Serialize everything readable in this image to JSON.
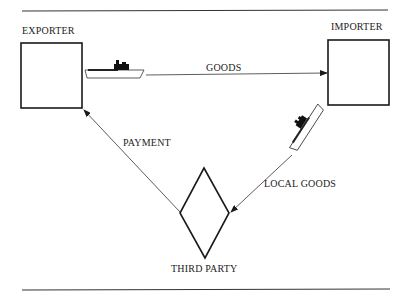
{
  "diagram": {
    "nodes": {
      "exporter": {
        "label": "EXPORTER",
        "shape": "square"
      },
      "importer": {
        "label": "IMPORTER",
        "shape": "square"
      },
      "third_party": {
        "label": "THIRD PARTY",
        "shape": "diamond"
      }
    },
    "edges": {
      "goods": {
        "label": "GOODS",
        "from": "exporter",
        "to": "importer",
        "icon": "ship-icon"
      },
      "local_goods": {
        "label": "LOCAL GOODS",
        "from": "importer",
        "to": "third_party",
        "icon": "ship-icon"
      },
      "payment": {
        "label": "PAYMENT",
        "from": "third_party",
        "to": "exporter"
      }
    },
    "colors": {
      "stroke": "#1a1a1a",
      "background": "#ffffff"
    }
  }
}
